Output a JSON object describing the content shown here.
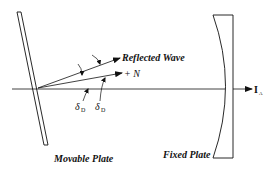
{
  "diagram": {
    "labels": {
      "reflected_wave": "Reflected Wave",
      "normal": "+ N",
      "delta_1": "δ",
      "delta_1_sub": "D",
      "delta_2": "δ",
      "delta_2_sub": "D",
      "axis": "I",
      "axis_sub": "A",
      "movable_plate": "Movable Plate",
      "fixed_plate": "Fixed Plate"
    },
    "colors": {
      "stroke": "#111111",
      "background": "#ffffff"
    }
  }
}
